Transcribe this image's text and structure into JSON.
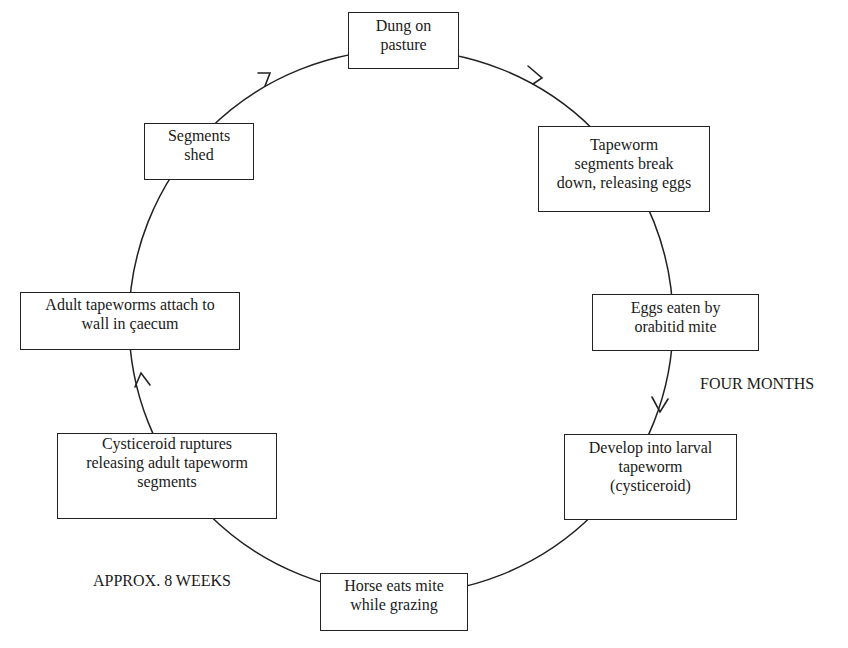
{
  "diagram": {
    "type": "cycle",
    "title": "",
    "stages": [
      {
        "id": "dung",
        "text": "Dung on\npasture"
      },
      {
        "id": "breakdown",
        "text": "Tapeworm\nsegments break\ndown, releasing eggs"
      },
      {
        "id": "mite",
        "text": "Eggs eaten by\norabitid mite"
      },
      {
        "id": "larval",
        "text": "Develop into larval\ntapeworm\n(cysticeroid)"
      },
      {
        "id": "horse",
        "text": "Horse eats mite\nwhile grazing"
      },
      {
        "id": "rupture",
        "text": "Cysticeroid ruptures\nreleasing adult tapeworm\nsegments"
      },
      {
        "id": "attach",
        "text": "Adult tapeworms attach to\nwall in çaecum"
      },
      {
        "id": "shed",
        "text": "Segments\nshed"
      }
    ],
    "annotations": {
      "four_months": "FOUR MONTHS",
      "eight_weeks": "APPROX. 8 WEEKS"
    },
    "colors": {
      "line": "#222222",
      "background": "#ffffff"
    }
  }
}
